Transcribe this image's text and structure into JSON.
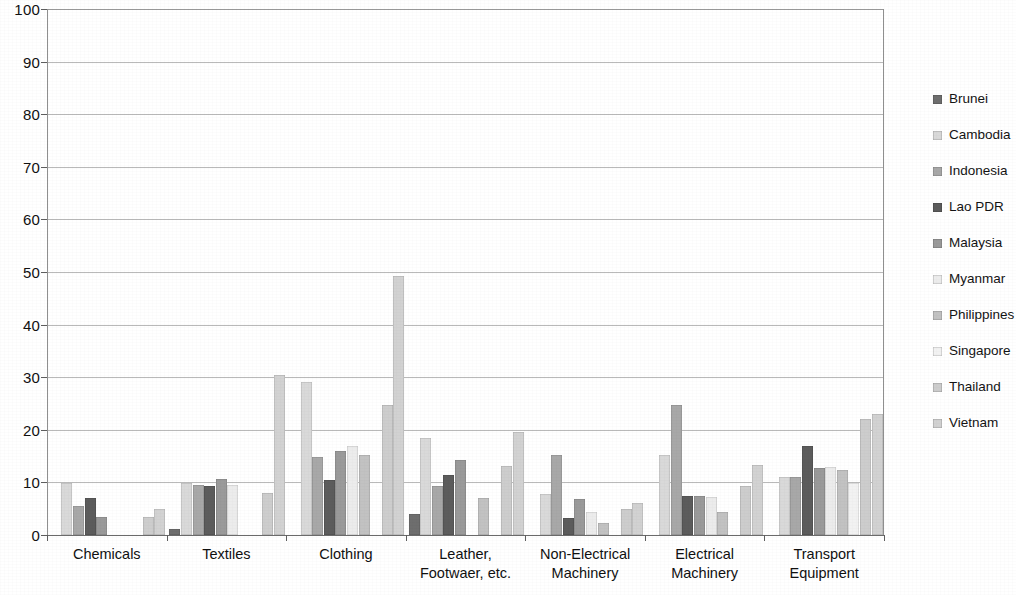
{
  "chart_data": {
    "type": "bar",
    "title": "",
    "subtitle": "",
    "xlabel": "",
    "ylabel": "",
    "ylim": [
      0,
      100
    ],
    "ytick_labels": [
      "100",
      "90",
      "80",
      "70",
      "60",
      "50",
      "40",
      "30",
      "20",
      "10",
      "0"
    ],
    "ytick_values": [
      100,
      90,
      80,
      70,
      60,
      50,
      40,
      30,
      20,
      10,
      0
    ],
    "grid": true,
    "grid_orientation": "horizontal",
    "legend_position": "right",
    "categories": [
      "Chemicals",
      "Textiles",
      "Clothing",
      "Leather,\nFootwaer, etc.",
      "Non-Electrical\nMachinery",
      "Electrical\nMachinery",
      "Transport\nEquipment"
    ],
    "series": [
      {
        "name": "Brunei",
        "color": "#6e6e6e",
        "values": [
          0,
          1.1,
          0,
          4.0,
          0,
          0,
          0
        ]
      },
      {
        "name": "Cambodia",
        "color": "#d9d9d9",
        "values": [
          9.8,
          9.8,
          29.0,
          18.5,
          7.8,
          15.3,
          11.0
        ]
      },
      {
        "name": "Indonesia",
        "color": "#a8a8a8",
        "values": [
          5.5,
          9.5,
          14.8,
          9.3,
          15.2,
          24.8,
          11.0
        ]
      },
      {
        "name": "Lao PDR",
        "color": "#5c5c5c",
        "values": [
          7.0,
          9.3,
          10.5,
          11.5,
          3.3,
          7.5,
          17.0
        ]
      },
      {
        "name": "Malaysia",
        "color": "#9a9a9a",
        "values": [
          3.5,
          10.7,
          16.0,
          14.3,
          6.8,
          7.5,
          12.7
        ]
      },
      {
        "name": "Myanmar",
        "color": "#ececec",
        "values": [
          0,
          9.5,
          17.0,
          0,
          4.3,
          7.3,
          13.0
        ]
      },
      {
        "name": "Philippines",
        "color": "#c2c2c2",
        "values": [
          0,
          0,
          15.3,
          7.0,
          2.2,
          4.3,
          12.3
        ]
      },
      {
        "name": "Singapore",
        "color": "#f2f2f2",
        "values": [
          0,
          0,
          0,
          0,
          0,
          0,
          9.8
        ]
      },
      {
        "name": "Thailand",
        "color": "#cdcdcd",
        "values": [
          3.5,
          8.0,
          24.8,
          13.2,
          5.0,
          9.3,
          22.0
        ]
      },
      {
        "name": "Vietnam",
        "color": "#d2d2d2",
        "values": [
          5.0,
          30.5,
          49.3,
          19.5,
          6.0,
          13.3,
          23.0
        ]
      }
    ]
  }
}
